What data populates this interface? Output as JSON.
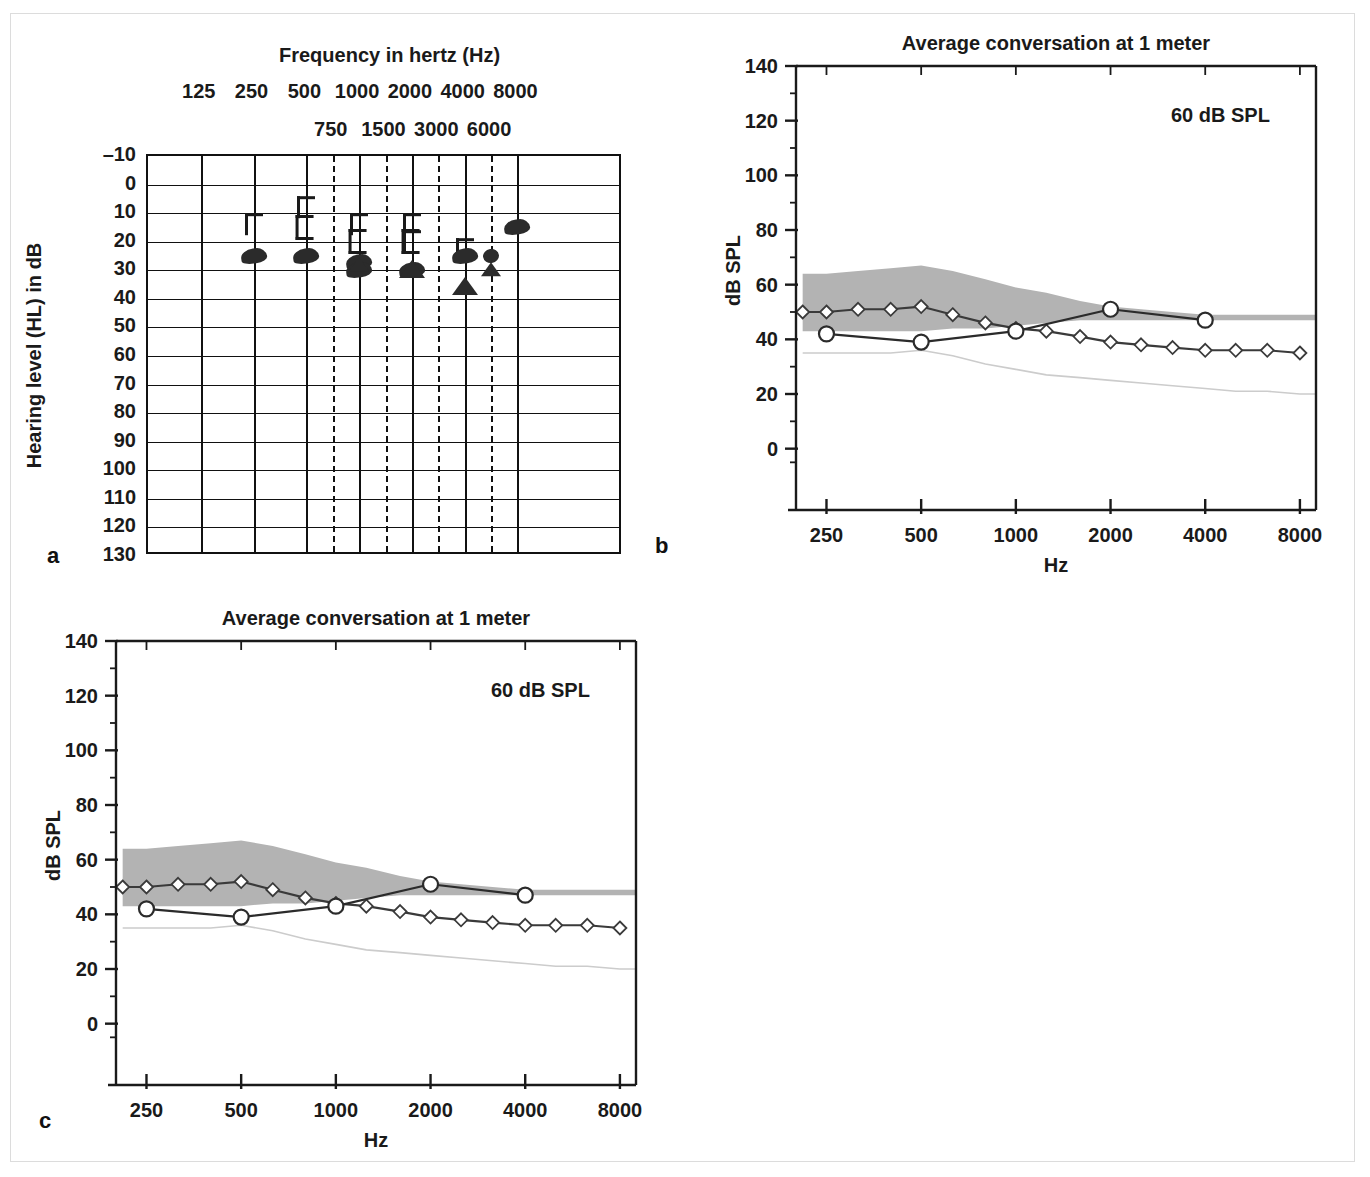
{
  "figure": {
    "panel_labels": {
      "a": "a",
      "b": "b",
      "c": "c"
    }
  },
  "audiogram": {
    "title": "Frequency in hertz (Hz)",
    "y_axis_title": "Hearing level (HL) in dB",
    "octave_frequencies": [
      "125",
      "250",
      "500",
      "1000",
      "2000",
      "4000",
      "8000"
    ],
    "interoctave_frequencies": [
      "750",
      "1500",
      "3000",
      "6000"
    ],
    "hl_ticks": [
      "–10",
      "0",
      "10",
      "20",
      "30",
      "40",
      "50",
      "60",
      "70",
      "80",
      "90",
      "100",
      "110",
      "120",
      "130"
    ],
    "hl_range": [
      -10,
      130
    ],
    "symbols": [
      {
        "type": "bone-right-masked",
        "freq": 250,
        "hl": 13
      },
      {
        "type": "bone-left-masked",
        "freq": 500,
        "hl": 14
      },
      {
        "type": "bone-right-masked",
        "freq": 500,
        "hl": 7
      },
      {
        "type": "bone-right-masked",
        "freq": 1000,
        "hl": 13
      },
      {
        "type": "bone-left-masked",
        "freq": 1000,
        "hl": 19
      },
      {
        "type": "bone-right-masked",
        "freq": 2000,
        "hl": 13
      },
      {
        "type": "bone-left-masked",
        "freq": 2000,
        "hl": 19
      },
      {
        "type": "bone-right-masked",
        "freq": 2000,
        "hl": 19
      },
      {
        "type": "bone-right-masked",
        "freq": 4000,
        "hl": 22
      },
      {
        "type": "aided-soundfield",
        "freq": 250,
        "hl": 25
      },
      {
        "type": "aided-soundfield",
        "freq": 500,
        "hl": 25
      },
      {
        "type": "aided-soundfield",
        "freq": 1000,
        "hl": 27
      },
      {
        "type": "aided-soundfield",
        "freq": 1000,
        "hl": 30
      },
      {
        "type": "aided-soundfield",
        "freq": 2000,
        "hl": 30
      },
      {
        "type": "aided-soundfield",
        "freq": 4000,
        "hl": 25
      },
      {
        "type": "aided-soundfield",
        "freq": 6000,
        "hl": 25
      },
      {
        "type": "aided-soundfield",
        "freq": 8000,
        "hl": 15
      },
      {
        "type": "aided-triangle",
        "freq": 1000,
        "hl": 28
      },
      {
        "type": "aided-triangle",
        "freq": 2000,
        "hl": 30
      },
      {
        "type": "aided-triangle",
        "freq": 4000,
        "hl": 36
      },
      {
        "type": "aided-triangle",
        "freq": 6000,
        "hl": 30
      }
    ]
  },
  "chart_data": [
    {
      "id": "panel-b",
      "type": "line",
      "title": "Average conversation at 1 meter",
      "annotation": "60 dB SPL",
      "xlabel": "Hz",
      "ylabel": "dB SPL",
      "xscale": "log",
      "xlim": [
        200,
        9000
      ],
      "ylim": [
        -10,
        140
      ],
      "ytick_labels": [
        "0",
        "20",
        "40",
        "60",
        "80",
        "100",
        "120",
        "140"
      ],
      "yticks": [
        0,
        20,
        40,
        60,
        80,
        100,
        120,
        140
      ],
      "xtick_labels": [
        "250",
        "500",
        "1000",
        "2000",
        "4000",
        "8000"
      ],
      "xticks": [
        250,
        500,
        1000,
        2000,
        4000,
        8000
      ],
      "grid": false,
      "legend": "none",
      "band": {
        "name": "Speech spectrum (long-term average speech banana)",
        "fill": "#b3b3b3",
        "x": [
          210,
          250,
          315,
          400,
          500,
          630,
          800,
          1000,
          1250,
          1600,
          2000,
          2500,
          3150,
          4000,
          5000,
          6300,
          8000,
          9000
        ],
        "upper": [
          64,
          64,
          65,
          66,
          67,
          65,
          62,
          59,
          57,
          54,
          52,
          51,
          50,
          49,
          49,
          49,
          49,
          49
        ],
        "lower": [
          43,
          43,
          43,
          43,
          43,
          44,
          44,
          45,
          46,
          47,
          47,
          47,
          47,
          47,
          47,
          47,
          47,
          47
        ]
      },
      "thin_line": {
        "name": "Threshold of audibility reference",
        "color": "#cccccc",
        "x": [
          210,
          250,
          315,
          400,
          500,
          630,
          800,
          1000,
          1250,
          1600,
          2000,
          2500,
          3150,
          4000,
          5000,
          6300,
          8000,
          9000
        ],
        "y": [
          35,
          35,
          35,
          35,
          36,
          34,
          31,
          29,
          27,
          26,
          25,
          24,
          23,
          22,
          21,
          21,
          20,
          20
        ]
      },
      "series": [
        {
          "name": "Aided response (diamonds)",
          "marker": "diamond",
          "color": "#3a3a3a",
          "x": [
            210,
            250,
            315,
            400,
            500,
            630,
            800,
            1000,
            1250,
            1600,
            2000,
            2500,
            3150,
            4000,
            5000,
            6300,
            8000
          ],
          "y": [
            50,
            50,
            51,
            51,
            52,
            49,
            46,
            44,
            43,
            41,
            39,
            38,
            37,
            36,
            36,
            36,
            35
          ]
        },
        {
          "name": "Aided soundfield thresholds (circles)",
          "marker": "circle",
          "color": "#2b2b2b",
          "x": [
            250,
            500,
            1000,
            2000,
            4000
          ],
          "y": [
            42,
            39,
            43,
            51,
            47
          ]
        }
      ]
    },
    {
      "id": "panel-c",
      "type": "line",
      "title": "Average conversation at 1 meter",
      "annotation": "60 dB SPL",
      "xlabel": "Hz",
      "ylabel": "dB SPL",
      "xscale": "log",
      "xlim": [
        200,
        9000
      ],
      "ylim": [
        -10,
        140
      ],
      "ytick_labels": [
        "0",
        "20",
        "40",
        "60",
        "80",
        "100",
        "120",
        "140"
      ],
      "yticks": [
        0,
        20,
        40,
        60,
        80,
        100,
        120,
        140
      ],
      "xtick_labels": [
        "250",
        "500",
        "1000",
        "2000",
        "4000",
        "8000"
      ],
      "xticks": [
        250,
        500,
        1000,
        2000,
        4000,
        8000
      ],
      "grid": false,
      "legend": "none",
      "band": {
        "name": "Speech spectrum (long-term average speech banana)",
        "fill": "#b3b3b3",
        "x": [
          210,
          250,
          315,
          400,
          500,
          630,
          800,
          1000,
          1250,
          1600,
          2000,
          2500,
          3150,
          4000,
          5000,
          6300,
          8000,
          9000
        ],
        "upper": [
          64,
          64,
          65,
          66,
          67,
          65,
          62,
          59,
          57,
          54,
          52,
          51,
          50,
          49,
          49,
          49,
          49,
          49
        ],
        "lower": [
          43,
          43,
          43,
          43,
          43,
          44,
          44,
          45,
          46,
          47,
          47,
          47,
          47,
          47,
          47,
          47,
          47,
          47
        ]
      },
      "thin_line": {
        "name": "Threshold of audibility reference",
        "color": "#cccccc",
        "x": [
          210,
          250,
          315,
          400,
          500,
          630,
          800,
          1000,
          1250,
          1600,
          2000,
          2500,
          3150,
          4000,
          5000,
          6300,
          8000,
          9000
        ],
        "y": [
          35,
          35,
          35,
          35,
          36,
          34,
          31,
          29,
          27,
          26,
          25,
          24,
          23,
          22,
          21,
          21,
          20,
          20
        ]
      },
      "series": [
        {
          "name": "Aided response (diamonds)",
          "marker": "diamond",
          "color": "#3a3a3a",
          "x": [
            210,
            250,
            315,
            400,
            500,
            630,
            800,
            1000,
            1250,
            1600,
            2000,
            2500,
            3150,
            4000,
            5000,
            6300,
            8000
          ],
          "y": [
            50,
            50,
            51,
            51,
            52,
            49,
            46,
            44,
            43,
            41,
            39,
            38,
            37,
            36,
            36,
            36,
            35
          ]
        },
        {
          "name": "Aided soundfield thresholds (circles)",
          "marker": "circle",
          "color": "#2b2b2b",
          "x": [
            250,
            500,
            1000,
            2000,
            4000
          ],
          "y": [
            42,
            39,
            43,
            51,
            47
          ]
        }
      ]
    }
  ]
}
